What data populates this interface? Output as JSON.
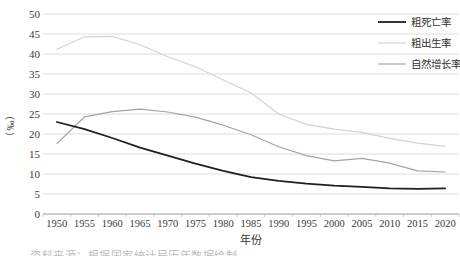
{
  "chart_data": {
    "type": "line",
    "title": "",
    "xlabel": "年份",
    "ylabel": "（‰）",
    "ylim": [
      0,
      50
    ],
    "ytick_step": 5,
    "yticks": [
      0,
      5,
      10,
      15,
      20,
      25,
      30,
      35,
      40,
      45,
      50
    ],
    "grid": true,
    "legend_position": "top-right",
    "x": [
      1950,
      1955,
      1960,
      1965,
      1970,
      1975,
      1980,
      1985,
      1990,
      1995,
      2000,
      2005,
      2010,
      2015,
      2020
    ],
    "series": [
      {
        "name": "粗死亡率",
        "key": "crude-death-rate",
        "color": "#1f1f1f",
        "width": 1.8,
        "values": [
          23.0,
          21.2,
          19.0,
          16.6,
          14.6,
          12.6,
          10.8,
          9.2,
          8.3,
          7.6,
          7.1,
          6.8,
          6.4,
          6.3,
          6.4
        ]
      },
      {
        "name": "粗出生率",
        "key": "crude-birth-rate",
        "color": "#d3d3d3",
        "width": 1.2,
        "values": [
          41.2,
          44.3,
          44.4,
          42.3,
          39.3,
          36.8,
          33.5,
          30.3,
          25.0,
          22.4,
          21.2,
          20.4,
          18.9,
          17.7,
          16.9
        ]
      },
      {
        "name": "自然增长率",
        "key": "natural-growth-rate",
        "color": "#a3a3a3",
        "width": 1.2,
        "values": [
          17.6,
          24.3,
          25.6,
          26.2,
          25.5,
          24.2,
          22.2,
          19.8,
          16.8,
          14.6,
          13.3,
          13.9,
          12.7,
          10.8,
          10.5
        ]
      }
    ]
  },
  "caption_partial": "资料来源：根据国家统计局历年数据绘制。",
  "colors": {
    "gridline": "#dcdcdc",
    "axis_line": "#9a9a9a",
    "tick_mark": "#bfbfbf",
    "tick_label": "#3a3a3a",
    "legend_text": "#333333",
    "background": "#ffffff"
  }
}
